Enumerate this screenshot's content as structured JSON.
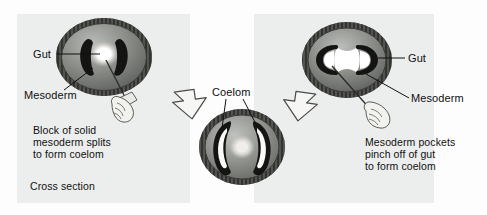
{
  "figure": {
    "background_color": "#fdfdfd",
    "panel_color": "#eceeed"
  },
  "panels": {
    "left": {
      "name": "schizocoely-panel",
      "labels": {
        "gut": "Gut",
        "mesoderm": "Mesoderm"
      },
      "caption_lines": [
        "Block of solid",
        "mesoderm splits",
        "to form coelom"
      ],
      "footer": "Cross section",
      "embryo": {
        "ectoderm_color": "#595a58",
        "endoderm_color": "#8e908c",
        "mesoderm_color": "#1b1b1b",
        "gut_color": "#fdfdfb",
        "mesoderm_state": "solid-block"
      },
      "tool": "probe-in-hand"
    },
    "middle": {
      "name": "coelom-panel",
      "labels": {
        "coelom": "Coelom"
      },
      "embryo": {
        "ectoderm_color": "#595a58",
        "endoderm_color": "#8e908c",
        "mesoderm_color": "#1b1b1b",
        "coelom_color": "#f7f7f5",
        "gut_color": "#eceae6",
        "mesoderm_state": "split-c-shaped"
      }
    },
    "right": {
      "name": "enterocoely-panel",
      "labels": {
        "gut": "Gut",
        "mesoderm": "Mesoderm"
      },
      "caption_lines": [
        "Mesoderm pockets",
        "pinch off of gut",
        "to form coelom"
      ],
      "embryo": {
        "ectoderm_color": "#595a58",
        "endoderm_color": "#8e908c",
        "mesoderm_color": "#1b1b1b",
        "gut_color": "#fdfdfb",
        "mesoderm_state": "pinching-pockets"
      },
      "tool": "probe-in-hand"
    }
  },
  "arrows": [
    {
      "name": "arrow-left-to-middle",
      "direction": "down-right",
      "fill": "#f6f6f4",
      "stroke": "#4a4a48"
    },
    {
      "name": "arrow-right-to-middle",
      "direction": "down-left",
      "fill": "#f6f6f4",
      "stroke": "#4a4a48"
    }
  ],
  "leader_line_color": "#111111"
}
